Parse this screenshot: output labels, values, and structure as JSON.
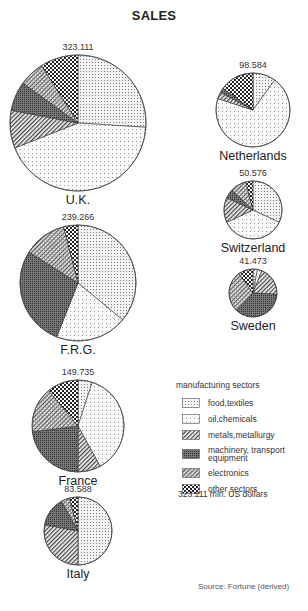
{
  "title": "SALES",
  "legend": {
    "title": "manufacturing sectors",
    "items": [
      {
        "key": "food",
        "label": "food,textiles",
        "pattern": "dots-medium"
      },
      {
        "key": "oil",
        "label": "oil,chemicals",
        "pattern": "dots-light"
      },
      {
        "key": "metals",
        "label": "metals,metallurgy",
        "pattern": "diagonal-hatch"
      },
      {
        "key": "machinery",
        "label": "machinery, transport equipment",
        "pattern": "dark-dense"
      },
      {
        "key": "electronics",
        "label": "electronics",
        "pattern": "cross-hatch"
      },
      {
        "key": "other",
        "label": "other sectors",
        "pattern": "checker"
      }
    ],
    "unit_note": "323.111 mln. US dollars"
  },
  "source": "Source: Fortune (derived)",
  "chart_data": {
    "type": "pie",
    "title": "SALES",
    "unit": "mln. US dollars",
    "sector_order": [
      "food,textiles",
      "oil,chemicals",
      "metals,metallurgy",
      "machinery, transport equipment",
      "electronics",
      "other sectors"
    ],
    "pies": [
      {
        "country": "U.K.",
        "total": "323.111",
        "cx": 78,
        "cy": 123,
        "r": 68,
        "shares_pct": [
          26,
          43,
          9,
          7,
          6,
          9
        ]
      },
      {
        "country": "F.R.G.",
        "total": "239.266",
        "cx": 78,
        "cy": 283,
        "r": 58,
        "shares_pct": [
          36,
          20,
          0,
          28,
          12,
          4
        ]
      },
      {
        "country": "France",
        "total": "149.735",
        "cx": 78,
        "cy": 426,
        "r": 46,
        "shares_pct": [
          5,
          37,
          8,
          23,
          16,
          11
        ]
      },
      {
        "country": "Italy",
        "total": "83.588",
        "cx": 78,
        "cy": 531,
        "r": 34,
        "shares_pct": [
          50,
          0,
          28,
          14,
          4,
          4
        ]
      },
      {
        "country": "Netherlands",
        "total": "98.584",
        "cx": 253,
        "cy": 110,
        "r": 37,
        "shares_pct": [
          10,
          70,
          3,
          2,
          0,
          15
        ]
      },
      {
        "country": "Switzerland",
        "total": "50.576",
        "cx": 253,
        "cy": 210,
        "r": 29,
        "shares_pct": [
          32,
          36,
          14,
          5,
          9,
          4
        ]
      },
      {
        "country": "Sweden",
        "total": "41.473",
        "cx": 253,
        "cy": 293,
        "r": 24,
        "shares_pct": [
          3,
          3,
          20,
          36,
          28,
          10
        ]
      }
    ]
  }
}
